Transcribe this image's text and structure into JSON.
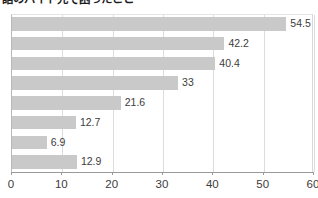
{
  "chart_data": {
    "type": "bar",
    "orientation": "horizontal",
    "title": "話のバイト先で困ったこと",
    "xlabel": "",
    "ylabel": "",
    "categories": [
      "",
      "",
      "",
      "",
      "",
      "",
      "",
      ""
    ],
    "values": [
      54.5,
      42.2,
      40.4,
      33,
      21.6,
      12.7,
      6.9,
      12.9
    ],
    "value_labels": [
      "54.5",
      "42.2",
      "40.4",
      "33",
      "21.6",
      "12.7",
      "6.9",
      "12.9"
    ],
    "xlim": [
      0,
      60
    ],
    "xticks": [
      0,
      10,
      20,
      30,
      40,
      50,
      60
    ],
    "xtick_labels": [
      "0",
      "10",
      "20",
      "30",
      "40",
      "50",
      "60"
    ],
    "grid": true,
    "legend": false,
    "bar_color": "#c9c9c9",
    "label_color": "#3c3c3c",
    "axis_color": "#9a9a9a",
    "gridline_color": "#dcdcdc",
    "background": "#ffffff"
  }
}
